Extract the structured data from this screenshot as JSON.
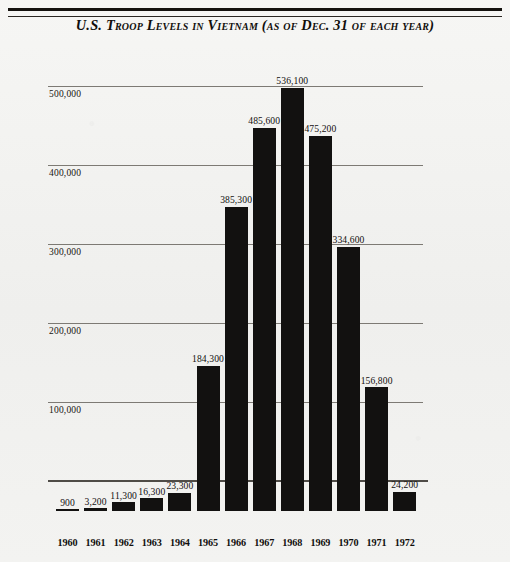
{
  "figure": {
    "title": "U.S. Troop Levels in Vietnam (as of Dec. 31 of each year)",
    "paper_color": "#f2f2f0",
    "ink_color": "#121110",
    "gridline_color": "#7d7a74",
    "baseline_color": "#4f4c47"
  },
  "chart_data": {
    "type": "bar",
    "title": "U.S. Troop Levels in Vietnam (as of Dec. 31 of each year)",
    "xlabel": "",
    "ylabel": "",
    "categories": [
      "1960",
      "1961",
      "1962",
      "1963",
      "1964",
      "1965",
      "1966",
      "1967",
      "1968",
      "1969",
      "1970",
      "1971",
      "1972"
    ],
    "values": [
      900,
      3200,
      11300,
      16300,
      23300,
      184300,
      385300,
      485600,
      536100,
      475200,
      334600,
      156800,
      24200
    ],
    "value_labels": [
      "900",
      "3,200",
      "11,300",
      "16,300",
      "23,300",
      "184,300",
      "385,300",
      "485,600",
      "536,100",
      "475,200",
      "334,600",
      "156,800",
      "24,200"
    ],
    "ylim": [
      0,
      560000
    ],
    "yticks": [
      100000,
      200000,
      300000,
      400000,
      500000
    ],
    "ytick_labels": [
      "100,000",
      "200,000",
      "300,000",
      "400,000",
      "500,000"
    ],
    "grid": true,
    "legend": "none",
    "bar_color": "#121110"
  }
}
